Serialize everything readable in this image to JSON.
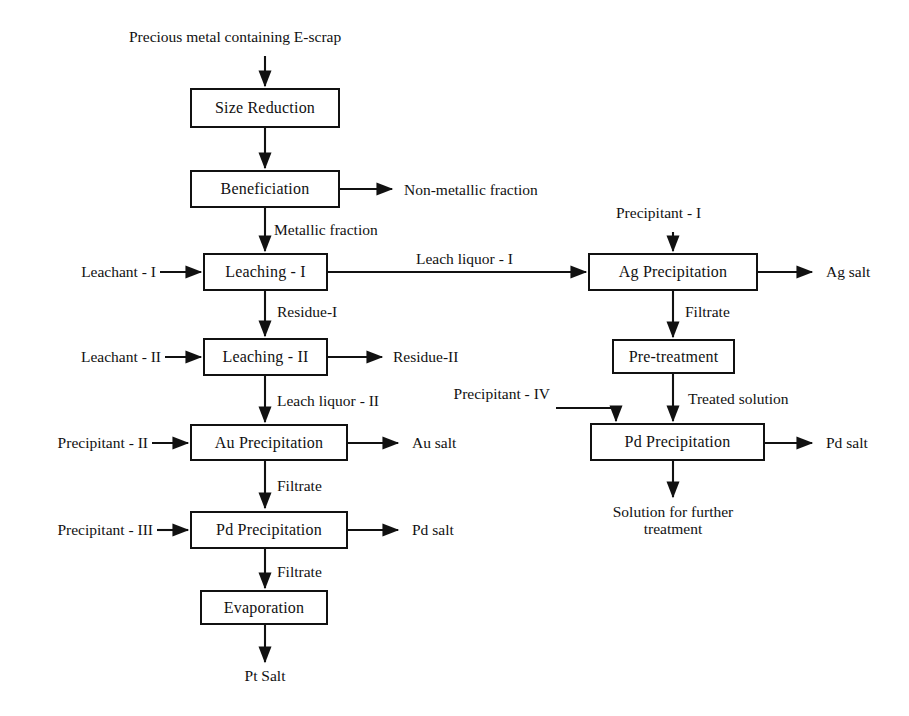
{
  "diagram": {
    "line_color": "#111111",
    "box_fill": "#ffffff",
    "background": "#ffffff",
    "nodes": [
      {
        "id": "size_reduction",
        "label": "Size Reduction"
      },
      {
        "id": "beneficiation",
        "label": "Beneficiation"
      },
      {
        "id": "leaching_1",
        "label": "Leaching - I"
      },
      {
        "id": "leaching_2",
        "label": "Leaching - II"
      },
      {
        "id": "au_precipitation",
        "label": "Au Precipitation"
      },
      {
        "id": "pd_precipitation_left",
        "label": "Pd Precipitation"
      },
      {
        "id": "evaporation",
        "label": "Evaporation"
      },
      {
        "id": "ag_precipitation",
        "label": "Ag Precipitation"
      },
      {
        "id": "pre_treatment",
        "label": "Pre-treatment"
      },
      {
        "id": "pd_precipitation_right",
        "label": "Pd Precipitation"
      }
    ],
    "labels": {
      "feed": "Precious metal containing E-scrap",
      "non_metallic_fraction": "Non-metallic fraction",
      "metallic_fraction": "Metallic fraction",
      "leachant_1": "Leachant - I",
      "leach_liquor_1": "Leach liquor - I",
      "residue_1": "Residue-I",
      "leachant_2": "Leachant - II",
      "residue_2": "Residue-II",
      "leach_liquor_2": "Leach liquor - II",
      "precipitant_2": "Precipitant - II",
      "au_salt": "Au salt",
      "filtrate_au": "Filtrate",
      "precipitant_3": "Precipitant - III",
      "pd_salt_left": "Pd salt",
      "filtrate_pd": "Filtrate",
      "pt_salt": "Pt Salt",
      "precipitant_1": "Precipitant - I",
      "ag_salt": "Ag salt",
      "filtrate_ag": "Filtrate",
      "precipitant_4": "Precipitant - IV",
      "treated_solution": "Treated solution",
      "pd_salt_right": "Pd salt",
      "solution_further_line1": "Solution for further",
      "solution_further_line2": "treatment"
    }
  }
}
